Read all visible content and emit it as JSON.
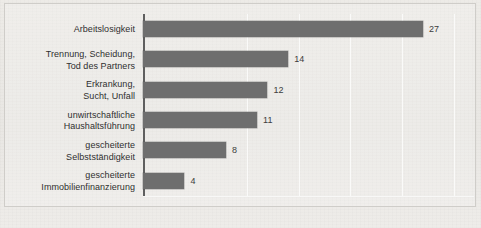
{
  "figure": {
    "background_color": "#eceae6",
    "bar_color": "#6e6e6e",
    "gridline_color": "#fbfbfa",
    "axis_color": "#5f5f5f",
    "text_color": "#2f2f2f"
  },
  "chart_data": {
    "type": "bar",
    "orientation": "horizontal",
    "title": "",
    "subtitle": "",
    "xlabel": "",
    "ylabel": "",
    "xlim": [
      0,
      32
    ],
    "grid": true,
    "gridlines": [
      10,
      15,
      20,
      25,
      30
    ],
    "legend": null,
    "legend_position": "none",
    "data_labels": true,
    "categories": [
      "Arbeitslosigkeit",
      "Trennung, Scheidung,\nTod des Partners",
      "Erkrankung,\nSucht, Unfall",
      "unwirtschaftliche\nHaushaltsführung",
      "gescheiterte\nSelbstständigkeit",
      "gescheiterte\nImmobilienfinanzierung"
    ],
    "values": [
      27,
      14,
      12,
      11,
      8,
      4
    ],
    "points": [
      {
        "label_line1": "Arbeitslosigkeit",
        "label_line2": "",
        "value": 27,
        "value_text": "27"
      },
      {
        "label_line1": "Trennung, Scheidung,",
        "label_line2": "Tod des Partners",
        "value": 14,
        "value_text": "14"
      },
      {
        "label_line1": "Erkrankung,",
        "label_line2": "Sucht, Unfall",
        "value": 12,
        "value_text": "12"
      },
      {
        "label_line1": "unwirtschaftliche",
        "label_line2": "Haushaltsführung",
        "value": 11,
        "value_text": "11"
      },
      {
        "label_line1": "gescheiterte",
        "label_line2": "Selbstständigkeit",
        "value": 8,
        "value_text": "8"
      },
      {
        "label_line1": "gescheiterte",
        "label_line2": "Immobilienfinanzierung",
        "value": 4,
        "value_text": "4"
      }
    ]
  }
}
